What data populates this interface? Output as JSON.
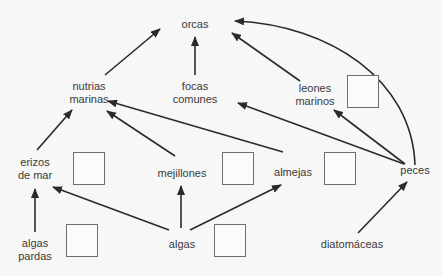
{
  "diagram": {
    "type": "food-web",
    "nodes": {
      "orcas": "orcas",
      "nutrias_1": "nutrias",
      "nutrias_2": "marinas",
      "focas_1": "focas",
      "focas_2": "comunes",
      "leones_1": "leones",
      "leones_2": "marinos",
      "erizos_1": "erizos",
      "erizos_2": "de mar",
      "mejillones": "mejillones",
      "almejas": "almejas",
      "peces": "peces",
      "algas_pardas_1": "algas",
      "algas_pardas_2": "pardas",
      "algas": "algas",
      "diatomaceas": "diatomáceas"
    },
    "edges": [
      {
        "from": "nutrias marinas",
        "to": "orcas"
      },
      {
        "from": "focas comunes",
        "to": "orcas"
      },
      {
        "from": "leones marinos",
        "to": "orcas"
      },
      {
        "from": "peces",
        "to": "orcas"
      },
      {
        "from": "erizos de mar",
        "to": "nutrias marinas"
      },
      {
        "from": "mejillones",
        "to": "nutrias marinas"
      },
      {
        "from": "almejas",
        "to": "nutrias marinas"
      },
      {
        "from": "peces",
        "to": "focas comunes"
      },
      {
        "from": "peces",
        "to": "leones marinos"
      },
      {
        "from": "algas pardas",
        "to": "erizos de mar"
      },
      {
        "from": "algas",
        "to": "erizos de mar"
      },
      {
        "from": "algas",
        "to": "mejillones"
      },
      {
        "from": "algas",
        "to": "almejas"
      },
      {
        "from": "diatomáceas",
        "to": "peces"
      }
    ],
    "answer_boxes": 6,
    "colors": {
      "line": "#2b2b2b",
      "box_border": "#6e6e6e",
      "text": "#3a3a3a",
      "background": "#f7f7f7"
    }
  }
}
